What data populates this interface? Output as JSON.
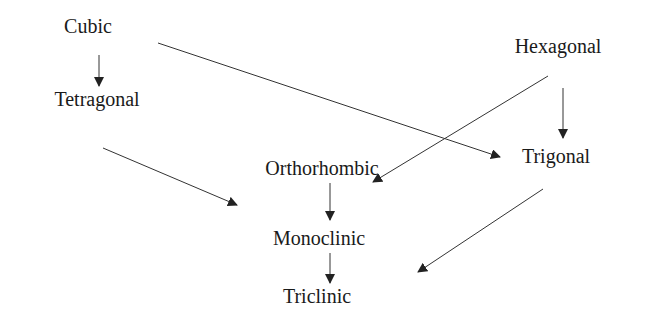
{
  "colors": {
    "text": "#1a1a1a",
    "edge": "#333333",
    "background": "#ffffff"
  },
  "nodes": {
    "cubic": {
      "label": "Cubic",
      "x": 88,
      "y": 26
    },
    "tetragonal": {
      "label": "Tetragonal",
      "x": 97,
      "y": 99
    },
    "hexagonal": {
      "label": "Hexagonal",
      "x": 558,
      "y": 46
    },
    "trigonal": {
      "label": "Trigonal",
      "x": 556,
      "y": 156
    },
    "orthorhombic": {
      "label": "Orthorhombic",
      "x": 322,
      "y": 168
    },
    "monoclinic": {
      "label": "Monoclinic",
      "x": 319,
      "y": 238
    },
    "triclinic": {
      "label": "Triclinic",
      "x": 317,
      "y": 296
    }
  },
  "edges": [
    {
      "from": "cubic",
      "to": "tetragonal",
      "x1": 99,
      "y1": 55,
      "x2": 99,
      "y2": 86
    },
    {
      "from": "cubic",
      "to": "trigonal",
      "x1": 158,
      "y1": 43,
      "x2": 500,
      "y2": 157
    },
    {
      "from": "hexagonal",
      "to": "trigonal",
      "x1": 563,
      "y1": 88,
      "x2": 563,
      "y2": 138
    },
    {
      "from": "hexagonal",
      "to": "orthorhombic",
      "x1": 548,
      "y1": 76,
      "x2": 373,
      "y2": 182
    },
    {
      "from": "tetragonal",
      "to": "orthorhombic",
      "x1": 103,
      "y1": 148,
      "x2": 237,
      "y2": 205
    },
    {
      "from": "trigonal",
      "to": "monoclinic",
      "x1": 543,
      "y1": 189,
      "x2": 418,
      "y2": 272
    },
    {
      "from": "orthorhombic",
      "to": "monoclinic",
      "x1": 330,
      "y1": 183,
      "x2": 330,
      "y2": 220
    },
    {
      "from": "monoclinic",
      "to": "triclinic",
      "x1": 330,
      "y1": 253,
      "x2": 330,
      "y2": 283
    }
  ]
}
